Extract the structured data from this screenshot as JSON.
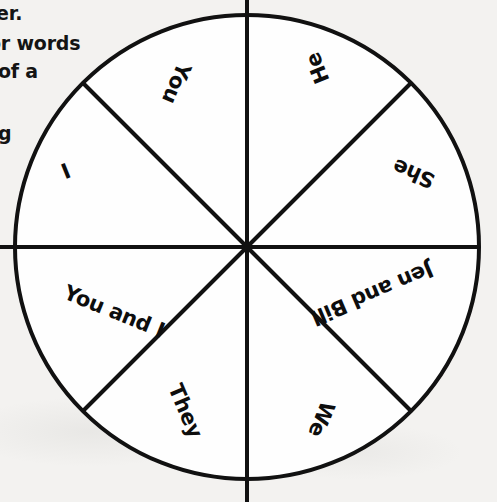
{
  "page": {
    "background_color": "#f3f2f0",
    "ink_color": "#0d0d0d"
  },
  "worksheet_text": {
    "fragment_1": "er.",
    "fragment_2": "or words",
    "fragment_3": "of a",
    "fragment_4": "g"
  },
  "wheel": {
    "center_x": 247,
    "center_y": 247,
    "radius": 232,
    "stroke_color": "#111111",
    "stroke_width": 4,
    "fill_color": "#fefefe",
    "sector_count": 8,
    "sectors": [
      {
        "label": "He",
        "start_deg": -90,
        "end_deg": -45,
        "mid_deg": -67.5,
        "rotation_deg": -112,
        "cx": 318,
        "cy": 68,
        "name": "sector-he"
      },
      {
        "label": "She",
        "start_deg": -45,
        "end_deg": 0,
        "mid_deg": -22.5,
        "rotation_deg": -157,
        "cx": 414,
        "cy": 173,
        "name": "sector-she"
      },
      {
        "label": "Jen and Bill",
        "start_deg": 0,
        "end_deg": 45,
        "mid_deg": 22.5,
        "rotation_deg": 157,
        "cx": 372,
        "cy": 293,
        "name": "sector-jen-and-bill"
      },
      {
        "label": "We",
        "start_deg": 45,
        "end_deg": 90,
        "mid_deg": 67.5,
        "rotation_deg": 113,
        "cx": 321,
        "cy": 419,
        "name": "sector-we"
      },
      {
        "label": "They",
        "start_deg": 90,
        "end_deg": 135,
        "mid_deg": 112.5,
        "rotation_deg": 67,
        "cx": 185,
        "cy": 411,
        "name": "sector-they"
      },
      {
        "label": "You and I",
        "start_deg": 135,
        "end_deg": 180,
        "mid_deg": 157.5,
        "rotation_deg": 22,
        "cx": 114,
        "cy": 312,
        "name": "sector-you-and-i"
      },
      {
        "label": "I",
        "start_deg": 180,
        "end_deg": 225,
        "mid_deg": 202.5,
        "rotation_deg": -22,
        "cx": 66,
        "cy": 172,
        "name": "sector-i"
      },
      {
        "label": "You",
        "start_deg": 225,
        "end_deg": 270,
        "mid_deg": 247.5,
        "rotation_deg": -247,
        "cx": 176,
        "cy": 83,
        "name": "sector-you"
      }
    ],
    "divider_lines": [
      {
        "name": "divider-vertical",
        "x1": 247,
        "y1": 0,
        "x2": 247,
        "y2": 502
      },
      {
        "name": "divider-horizontal",
        "x1": 0,
        "y1": 247,
        "x2": 479,
        "y2": 247
      },
      {
        "name": "divider-diagonal-nwse",
        "x1": 83,
        "y1": 83,
        "x2": 411,
        "y2": 411
      },
      {
        "name": "divider-diagonal-nesw",
        "x1": 411,
        "y1": 83,
        "x2": 83,
        "y2": 411
      }
    ]
  }
}
